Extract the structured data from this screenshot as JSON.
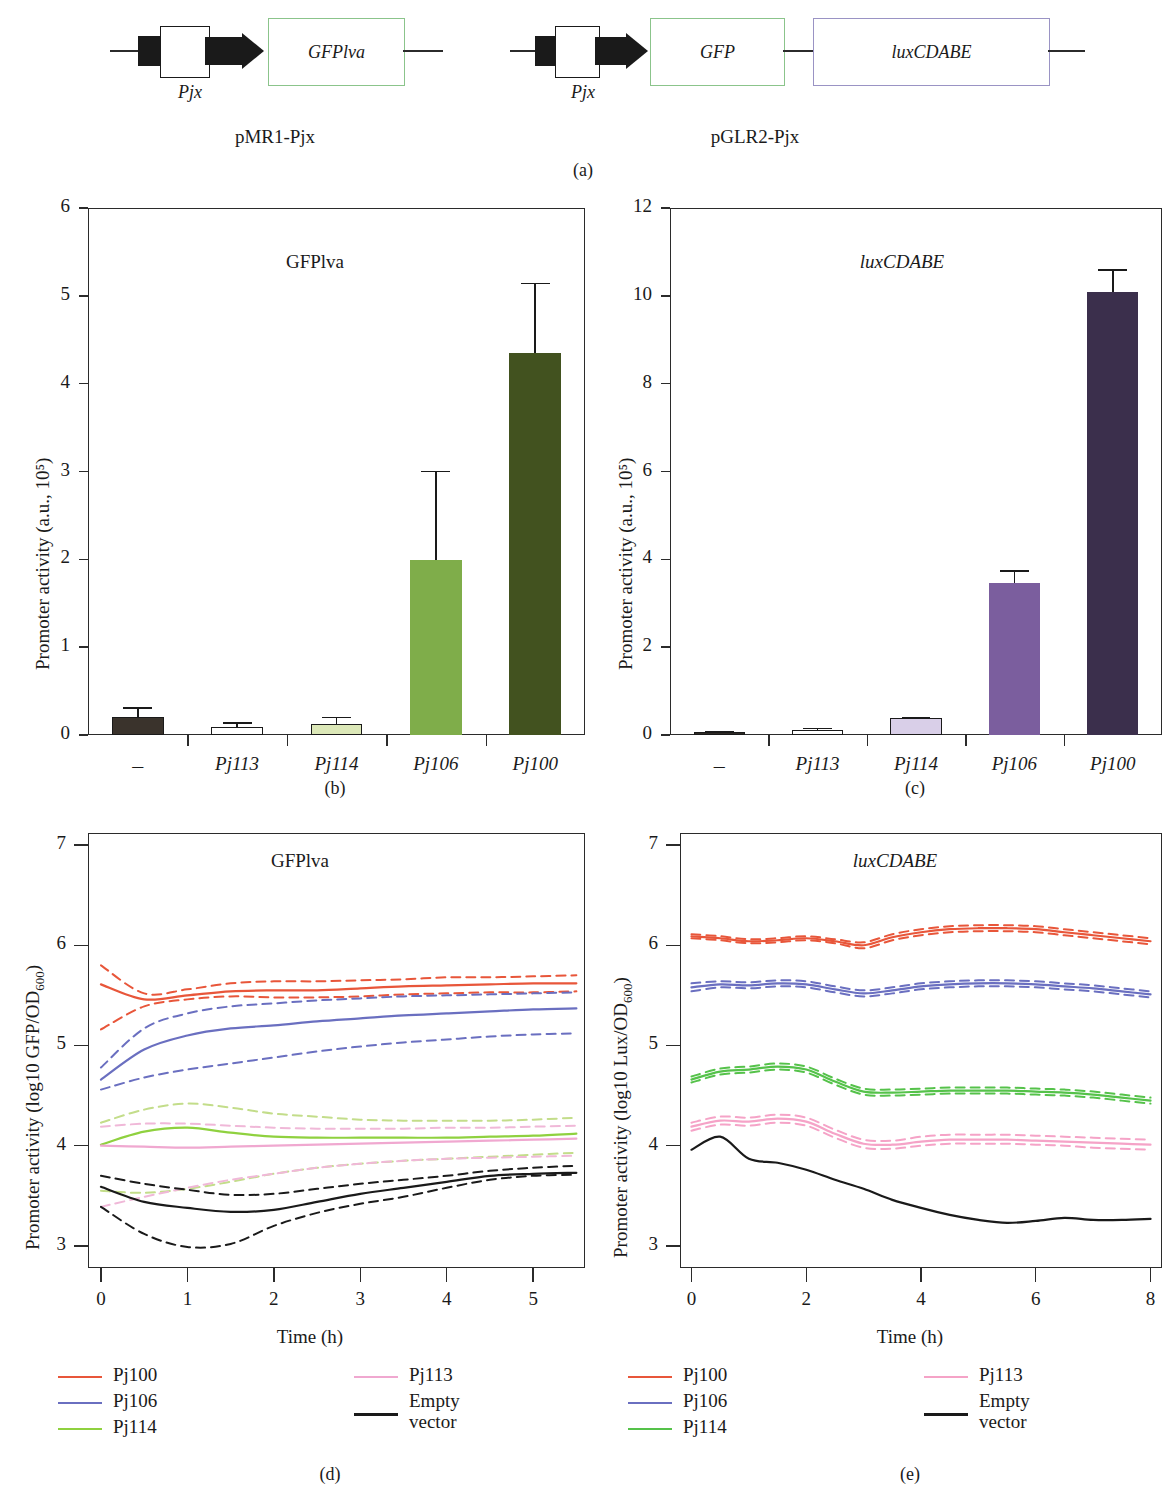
{
  "panel_a": {
    "caption": "(a)",
    "constructs": [
      {
        "name": "pMR1-Pjx",
        "promoter_label": "Pjx",
        "genes": [
          {
            "label": "GFPlva",
            "color": "#8bc48b"
          }
        ]
      },
      {
        "name": "pGLR2-Pjx",
        "promoter_label": "Pjx",
        "genes": [
          {
            "label": "GFP",
            "color": "#8bc48b"
          },
          {
            "label": "luxCDABE",
            "color": "#9a93c4"
          }
        ]
      }
    ]
  },
  "panel_b": {
    "caption": "(b)"
  },
  "panel_c": {
    "caption": "(c)"
  },
  "panel_d": {
    "caption": "(d)"
  },
  "panel_e": {
    "caption": "(e)"
  },
  "legend_d": {
    "col1": [
      {
        "label": "Pj100",
        "color": "#e8563a"
      },
      {
        "label": "Pj106",
        "color": "#6a6fc0"
      },
      {
        "label": "Pj114",
        "color": "#8fd13f"
      }
    ],
    "col2": [
      {
        "label": "Pj113",
        "color": "#f0a8d0"
      },
      {
        "label": "Empty\nvector",
        "color": "#1a1a1a"
      }
    ]
  },
  "legend_e": {
    "col1": [
      {
        "label": "Pj100",
        "color": "#e8563a"
      },
      {
        "label": "Pj106",
        "color": "#6a6fc0"
      },
      {
        "label": "Pj114",
        "color": "#55c24a"
      }
    ],
    "col2": [
      {
        "label": "Pj113",
        "color": "#f5a3c7"
      },
      {
        "label": "Empty\nvector",
        "color": "#1a1a1a"
      }
    ]
  },
  "chart_data": [
    {
      "panel": "b",
      "type": "bar",
      "title": "GFPlva",
      "title_italic": false,
      "xlabel": "",
      "ylabel": "Promoter activity (a.u., 10⁵)",
      "ylim": [
        0,
        6
      ],
      "yticks": [
        0,
        1,
        2,
        3,
        4,
        5,
        6
      ],
      "categories": [
        "–",
        "Pj113",
        "Pj114",
        "Pj106",
        "Pj100"
      ],
      "values": [
        0.2,
        0.09,
        0.12,
        1.99,
        4.35
      ],
      "errors": [
        0.12,
        0.06,
        0.09,
        1.02,
        0.8
      ],
      "colors": [
        "#3a332c",
        "#ffffff",
        "#dce8b8",
        "#7fad4a",
        "#42521f"
      ],
      "edge_colors": [
        "#1a1a1a",
        "#1a1a1a",
        "#1a1a1a",
        "#7fad4a",
        "#42521f"
      ],
      "grid": false,
      "legend": "none"
    },
    {
      "panel": "c",
      "type": "bar",
      "title": "luxCDABE",
      "title_italic": true,
      "xlabel": "",
      "ylabel": "Promoter activity (a.u., 10⁵)",
      "ylim": [
        0,
        12
      ],
      "yticks": [
        0,
        2,
        4,
        6,
        8,
        10,
        12
      ],
      "categories": [
        "–",
        "Pj113",
        "Pj114",
        "Pj106",
        "Pj100"
      ],
      "values": [
        0.06,
        0.12,
        0.39,
        3.45,
        10.08
      ],
      "errors": [
        0.03,
        0.05,
        0.03,
        0.3,
        0.53
      ],
      "colors": [
        "#2e2a25",
        "#ffffff",
        "#d9cfe8",
        "#7b5e9e",
        "#3b2f4c"
      ],
      "edge_colors": [
        "#1a1a1a",
        "#1a1a1a",
        "#1a1a1a",
        "#7b5e9e",
        "#3b2f4c"
      ],
      "grid": false,
      "legend": "none"
    },
    {
      "panel": "d",
      "type": "line",
      "title": "GFPlva",
      "title_italic": false,
      "xlabel": "Time (h)",
      "ylabel": "Promoter activity (log10 GFP/OD600)",
      "xlim": [
        -0.15,
        5.6
      ],
      "ylim": [
        2.78,
        7.12
      ],
      "xticks": [
        0,
        1,
        2,
        3,
        4,
        5
      ],
      "yticks": [
        3,
        4,
        5,
        6,
        7
      ],
      "x": [
        0,
        0.5,
        1,
        1.5,
        2,
        2.5,
        3,
        3.5,
        4,
        4.5,
        5,
        5.5
      ],
      "series": [
        {
          "name": "Pj100",
          "color": "#e8563a",
          "style": "solid",
          "values": [
            5.61,
            5.46,
            5.5,
            5.54,
            5.55,
            5.55,
            5.57,
            5.59,
            5.6,
            5.61,
            5.62,
            5.62
          ]
        },
        {
          "name": "Pj100 upper",
          "color": "#e8563a",
          "style": "dashed",
          "values": [
            5.8,
            5.52,
            5.56,
            5.62,
            5.64,
            5.64,
            5.65,
            5.66,
            5.68,
            5.68,
            5.69,
            5.7
          ]
        },
        {
          "name": "Pj100 lower",
          "color": "#e8563a",
          "style": "dashed",
          "values": [
            5.16,
            5.39,
            5.46,
            5.49,
            5.48,
            5.48,
            5.49,
            5.51,
            5.52,
            5.53,
            5.53,
            5.54
          ]
        },
        {
          "name": "Pj106",
          "color": "#6a6fc0",
          "style": "solid",
          "values": [
            4.66,
            4.96,
            5.1,
            5.17,
            5.2,
            5.24,
            5.27,
            5.3,
            5.32,
            5.34,
            5.36,
            5.37
          ]
        },
        {
          "name": "Pj106 upper",
          "color": "#6a6fc0",
          "style": "dashed",
          "values": [
            4.78,
            5.17,
            5.32,
            5.39,
            5.42,
            5.45,
            5.47,
            5.49,
            5.5,
            5.51,
            5.52,
            5.53
          ]
        },
        {
          "name": "Pj106 lower",
          "color": "#6a6fc0",
          "style": "dashed",
          "values": [
            4.56,
            4.68,
            4.76,
            4.82,
            4.88,
            4.94,
            4.99,
            5.03,
            5.06,
            5.09,
            5.11,
            5.12
          ]
        },
        {
          "name": "Pj114",
          "color": "#8fd13f",
          "style": "solid",
          "values": [
            4.01,
            4.14,
            4.18,
            4.13,
            4.09,
            4.08,
            4.08,
            4.08,
            4.08,
            4.09,
            4.1,
            4.12
          ]
        },
        {
          "name": "Pj114 upper",
          "color": "#c3dd8a",
          "style": "dashed",
          "values": [
            4.23,
            4.36,
            4.42,
            4.38,
            4.32,
            4.29,
            4.26,
            4.25,
            4.25,
            4.25,
            4.26,
            4.28
          ]
        },
        {
          "name": "Pj114 lower",
          "color": "#c3dd8a",
          "style": "dashed",
          "values": [
            3.55,
            3.53,
            3.57,
            3.64,
            3.72,
            3.78,
            3.82,
            3.85,
            3.87,
            3.89,
            3.91,
            3.93
          ]
        },
        {
          "name": "Pj113",
          "color": "#f0a8d0",
          "style": "solid",
          "values": [
            4.0,
            3.99,
            3.98,
            3.99,
            4.0,
            4.01,
            4.02,
            4.03,
            4.04,
            4.05,
            4.06,
            4.07
          ]
        },
        {
          "name": "Pj113 upper",
          "color": "#f0b8d8",
          "style": "dashed",
          "values": [
            4.19,
            4.22,
            4.22,
            4.2,
            4.18,
            4.17,
            4.17,
            4.17,
            4.18,
            4.18,
            4.19,
            4.2
          ]
        },
        {
          "name": "Pj113 lower",
          "color": "#f0b8d8",
          "style": "dashed",
          "values": [
            3.39,
            3.49,
            3.58,
            3.66,
            3.72,
            3.78,
            3.82,
            3.85,
            3.87,
            3.88,
            3.89,
            3.9
          ]
        },
        {
          "name": "Empty vector",
          "color": "#1a1a1a",
          "style": "solid",
          "values": [
            3.59,
            3.44,
            3.38,
            3.34,
            3.36,
            3.44,
            3.52,
            3.58,
            3.64,
            3.7,
            3.72,
            3.73
          ]
        },
        {
          "name": "Empty vector upper",
          "color": "#1a1a1a",
          "style": "dashed",
          "values": [
            3.7,
            3.62,
            3.56,
            3.51,
            3.52,
            3.57,
            3.62,
            3.66,
            3.7,
            3.75,
            3.78,
            3.8
          ]
        },
        {
          "name": "Empty vector lower",
          "color": "#1a1a1a",
          "style": "dashed",
          "values": [
            3.39,
            3.12,
            2.99,
            3.02,
            3.2,
            3.33,
            3.42,
            3.49,
            3.58,
            3.66,
            3.7,
            3.71
          ]
        }
      ],
      "grid": false,
      "legend": "below"
    },
    {
      "panel": "e",
      "type": "line",
      "title": "luxCDABE",
      "title_italic": true,
      "xlabel": "Time (h)",
      "ylabel": "Promoter activity (log10 Lux/OD600)",
      "xlim": [
        -0.2,
        8.2
      ],
      "ylim": [
        2.78,
        7.12
      ],
      "xticks": [
        0,
        2,
        4,
        6,
        8
      ],
      "yticks": [
        3,
        4,
        5,
        6,
        7
      ],
      "x": [
        0,
        0.5,
        1,
        1.5,
        2,
        2.5,
        3,
        3.5,
        4,
        4.5,
        5,
        5.5,
        6,
        6.5,
        7,
        7.5,
        8
      ],
      "series": [
        {
          "name": "Pj100",
          "color": "#e8563a",
          "style": "solid",
          "values": [
            6.09,
            6.07,
            6.04,
            6.05,
            6.07,
            6.04,
            6.0,
            6.08,
            6.13,
            6.16,
            6.17,
            6.17,
            6.16,
            6.13,
            6.1,
            6.07,
            6.04
          ]
        },
        {
          "name": "Pj100 upper",
          "color": "#e8563a",
          "style": "dashed",
          "values": [
            6.11,
            6.09,
            6.06,
            6.07,
            6.09,
            6.06,
            6.03,
            6.11,
            6.16,
            6.19,
            6.2,
            6.2,
            6.19,
            6.16,
            6.13,
            6.1,
            6.07
          ]
        },
        {
          "name": "Pj100 lower",
          "color": "#e8563a",
          "style": "dashed",
          "values": [
            6.07,
            6.05,
            6.02,
            6.03,
            6.05,
            6.02,
            5.97,
            6.05,
            6.1,
            6.13,
            6.14,
            6.14,
            6.13,
            6.1,
            6.07,
            6.04,
            6.01
          ]
        },
        {
          "name": "Pj106",
          "color": "#6a6fc0",
          "style": "solid",
          "values": [
            5.58,
            5.61,
            5.6,
            5.62,
            5.61,
            5.56,
            5.52,
            5.55,
            5.59,
            5.61,
            5.62,
            5.62,
            5.61,
            5.59,
            5.57,
            5.54,
            5.51
          ]
        },
        {
          "name": "Pj106 upper",
          "color": "#6a6fc0",
          "style": "dashed",
          "values": [
            5.62,
            5.64,
            5.63,
            5.65,
            5.64,
            5.59,
            5.55,
            5.58,
            5.62,
            5.64,
            5.65,
            5.65,
            5.64,
            5.62,
            5.6,
            5.57,
            5.54
          ]
        },
        {
          "name": "Pj106 lower",
          "color": "#6a6fc0",
          "style": "dashed",
          "values": [
            5.54,
            5.58,
            5.57,
            5.59,
            5.58,
            5.53,
            5.49,
            5.52,
            5.56,
            5.58,
            5.59,
            5.59,
            5.58,
            5.56,
            5.54,
            5.51,
            5.48
          ]
        },
        {
          "name": "Pj114",
          "color": "#55c24a",
          "style": "solid",
          "values": [
            4.66,
            4.74,
            4.76,
            4.79,
            4.76,
            4.64,
            4.54,
            4.53,
            4.54,
            4.55,
            4.55,
            4.55,
            4.54,
            4.53,
            4.51,
            4.48,
            4.45
          ]
        },
        {
          "name": "Pj114 upper",
          "color": "#55c24a",
          "style": "dashed",
          "values": [
            4.69,
            4.77,
            4.79,
            4.82,
            4.79,
            4.67,
            4.57,
            4.56,
            4.57,
            4.58,
            4.58,
            4.58,
            4.57,
            4.56,
            4.54,
            4.51,
            4.48
          ]
        },
        {
          "name": "Pj114 lower",
          "color": "#55c24a",
          "style": "dashed",
          "values": [
            4.63,
            4.71,
            4.73,
            4.76,
            4.73,
            4.61,
            4.51,
            4.5,
            4.51,
            4.52,
            4.52,
            4.52,
            4.51,
            4.5,
            4.48,
            4.45,
            4.42
          ]
        },
        {
          "name": "Pj113",
          "color": "#f5a3c7",
          "style": "solid",
          "values": [
            4.19,
            4.25,
            4.24,
            4.27,
            4.24,
            4.12,
            4.02,
            4.01,
            4.04,
            4.06,
            4.06,
            4.06,
            4.05,
            4.04,
            4.03,
            4.02,
            4.01
          ]
        },
        {
          "name": "Pj113 upper",
          "color": "#f5a3c7",
          "style": "dashed",
          "values": [
            4.23,
            4.29,
            4.28,
            4.31,
            4.28,
            4.16,
            4.06,
            4.05,
            4.09,
            4.11,
            4.11,
            4.11,
            4.1,
            4.09,
            4.08,
            4.07,
            4.06
          ]
        },
        {
          "name": "Pj113 lower",
          "color": "#f5a3c7",
          "style": "dashed",
          "values": [
            4.15,
            4.21,
            4.2,
            4.23,
            4.2,
            4.08,
            3.98,
            3.97,
            4.0,
            4.02,
            4.02,
            4.02,
            4.01,
            4.0,
            3.98,
            3.97,
            3.96
          ]
        },
        {
          "name": "Empty vector",
          "color": "#1a1a1a",
          "style": "solid",
          "values": [
            3.96,
            4.09,
            3.87,
            3.83,
            3.76,
            3.66,
            3.57,
            3.46,
            3.38,
            3.31,
            3.26,
            3.23,
            3.25,
            3.28,
            3.26,
            3.26,
            3.27
          ]
        }
      ],
      "grid": false,
      "legend": "below"
    }
  ]
}
